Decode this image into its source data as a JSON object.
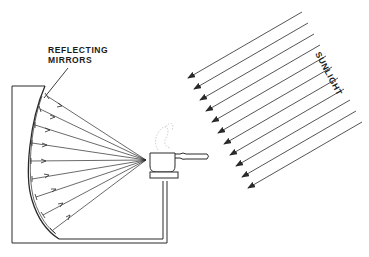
{
  "diagram": {
    "labels": {
      "mirrors_line1": "REFLECTING",
      "mirrors_line2": "MIRRORS",
      "sunlight": "SUNLIGHT"
    },
    "components": [
      "reflecting-mirrors",
      "parabolic-frame",
      "cooking-pot",
      "pot-stand",
      "sunlight-rays",
      "reflected-rays"
    ],
    "sunlight_ray_count": 11,
    "reflected_ray_count": 9,
    "colors": {
      "line": "#2a2a2a",
      "background": "#ffffff"
    }
  }
}
